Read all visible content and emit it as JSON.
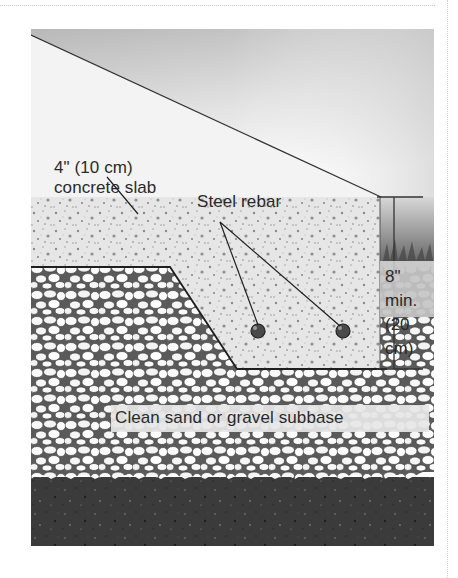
{
  "figure": {
    "labels": {
      "slab_line1": "4\" (10 cm)",
      "slab_line2": "concrete slab",
      "rebar": "Steel rebar",
      "dimension_line1": "8\" min.",
      "dimension_line2": "(20 cm)",
      "subbase": "Clean sand or gravel subbase"
    },
    "layers": [
      {
        "name": "sky",
        "color": "#bdbdbd"
      },
      {
        "name": "concrete-slab",
        "color": "#e4e4e4"
      },
      {
        "name": "gravel-subbase",
        "color": "#f2f2f2"
      },
      {
        "name": "native-soil",
        "color": "#3a3a3a"
      }
    ],
    "rebar_count": 2
  }
}
